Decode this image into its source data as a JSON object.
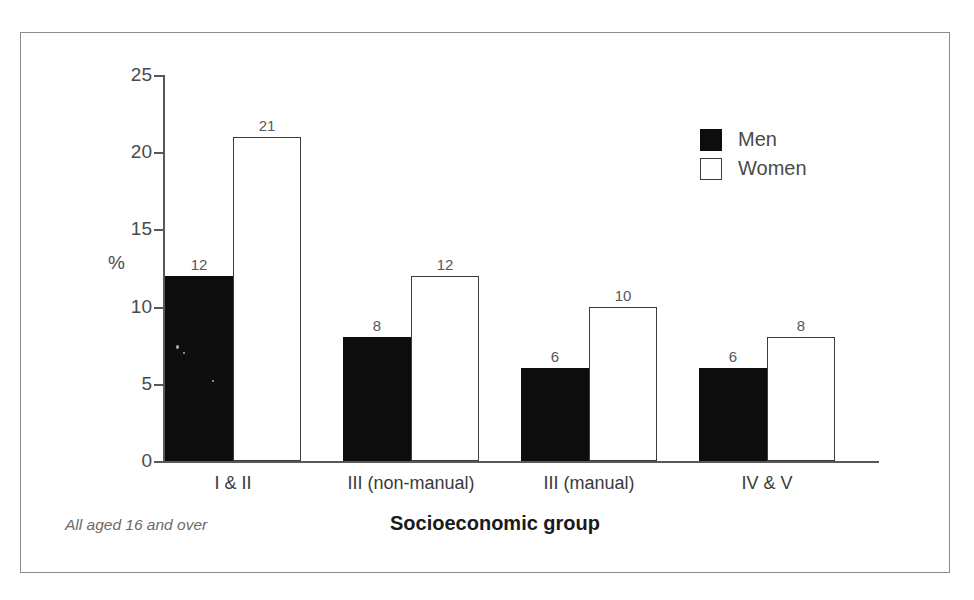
{
  "figure": {
    "title_truncated": "Socioeconomic group, 1998",
    "footnote": "All aged 16 and over"
  },
  "legend": {
    "items": [
      {
        "label": "Men",
        "swatch": "black-filled-square",
        "color": "#0d0d0d"
      },
      {
        "label": "Women",
        "swatch": "white-outlined-square",
        "color": "#ffffff"
      }
    ]
  },
  "axes": {
    "y_unit_label": "%",
    "x_title": "Socioeconomic group",
    "y_ticks": [
      "0",
      "5",
      "10",
      "15",
      "20",
      "25"
    ]
  },
  "chart_data": {
    "type": "bar",
    "title": "Socioeconomic group, 1998",
    "xlabel": "Socioeconomic group",
    "ylabel": "%",
    "ylim": [
      0,
      25
    ],
    "yticks": [
      0,
      5,
      10,
      15,
      20,
      25
    ],
    "grid": false,
    "legend_position": "top-right",
    "annotation": "All aged 16 and over",
    "categories": [
      "I & II",
      "III (non-manual)",
      "III (manual)",
      "IV & V"
    ],
    "series": [
      {
        "name": "Men",
        "color": "#0d0d0d",
        "values": [
          12,
          8,
          6,
          6
        ]
      },
      {
        "name": "Women",
        "color": "#ffffff",
        "values": [
          21,
          12,
          10,
          8
        ]
      }
    ],
    "data_labels": {
      "Men": [
        "12",
        "8",
        "6",
        "6"
      ],
      "Women": [
        "21",
        "12",
        "10",
        "8"
      ]
    }
  },
  "colors": {
    "frame": "#8c8c8c",
    "axis": "#58585a",
    "men_fill": "#0d0d0d",
    "women_stroke": "#3b3b3b",
    "label_text": "#4a4a4a",
    "footnote_text": "#6a6a6a"
  }
}
